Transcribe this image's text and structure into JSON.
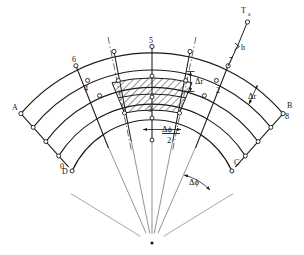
{
  "figure": {
    "title": "",
    "geometry": {
      "center_x": 152,
      "center_y": 228,
      "radii": [
        88,
        110,
        131,
        152,
        172
      ],
      "angle_start_deg": 203,
      "angle_end_deg": 337,
      "num_radial_lines": 7,
      "hatch_inner_radius": 131,
      "hatch_outer_radius": 172,
      "hatch_angle_half_deg": 19
    },
    "colors": {
      "line": "#1a1a1a",
      "thin_line": "#555555",
      "background": "#ffffff",
      "hatch": "#1a1a1a"
    }
  },
  "nodes": [
    {
      "id": "n0",
      "label": "0",
      "x": 63,
      "y": 166
    },
    {
      "id": "n2",
      "label": "2",
      "x": 215,
      "y": 91
    },
    {
      "id": "n3",
      "label": "3",
      "x": 152,
      "y": 109
    },
    {
      "id": "n4",
      "label": "4",
      "x": 87,
      "y": 88
    },
    {
      "id": "n5",
      "label": "5",
      "x": 152,
      "y": 48
    },
    {
      "id": "n6",
      "label": "6",
      "x": 76,
      "y": 65
    },
    {
      "id": "n7",
      "label": "7",
      "x": 230,
      "y": 66
    },
    {
      "id": "n8",
      "label": "8",
      "x": 283,
      "y": 115
    }
  ],
  "boundary_labels": [
    {
      "id": "A",
      "label": "A",
      "x": 16,
      "y": 108
    },
    {
      "id": "B",
      "label": "B",
      "x": 285,
      "y": 104
    },
    {
      "id": "C",
      "label": "C",
      "x": 236,
      "y": 164
    },
    {
      "id": "D",
      "label": "D",
      "x": 65,
      "y": 170
    }
  ],
  "dimensions": {
    "delta_r_inner": {
      "symbol": "Δr",
      "x": 196,
      "y": 81
    },
    "delta_r_outer": {
      "symbol": "Δr",
      "x": 251,
      "y": 96
    },
    "delta_phi_half": {
      "numerator": "Δϕ",
      "denominator": "2",
      "x": 166,
      "y": 136
    },
    "delta_phi": {
      "symbol": "Δϕ",
      "x": 196,
      "y": 182
    }
  },
  "convection": {
    "ambient_label": "T",
    "ambient_subscript": "a",
    "ambient_x": 245,
    "ambient_y": 13,
    "coefficient_label": "h",
    "coefficient_x": 238,
    "coefficient_y": 46
  }
}
